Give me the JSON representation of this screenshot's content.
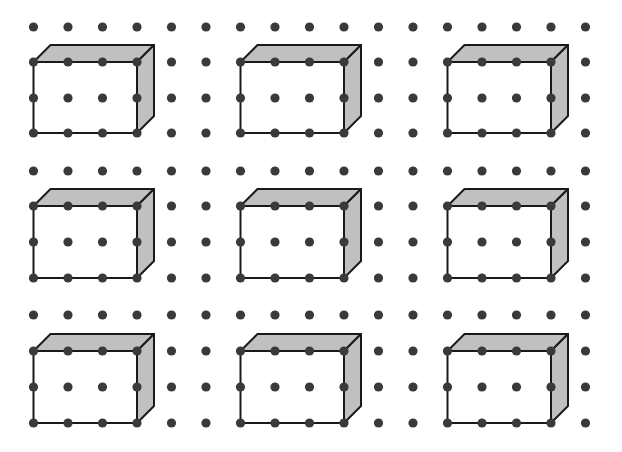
{
  "diagram": {
    "title": "Dot grid with 3×3 array of rectangular prisms",
    "canvas": {
      "width": 622,
      "height": 452,
      "background": "#ffffff"
    },
    "colors": {
      "dot": "#3a3a3a",
      "edge": "#1a1a1a",
      "face_front": "#ffffff",
      "face_shaded": "#c0c0c0"
    },
    "grid": {
      "columns_x": [
        33.5,
        68,
        102.5,
        137,
        171.5,
        206,
        240.5,
        275,
        309.5,
        344,
        378.5,
        413,
        447.5,
        482,
        516.5,
        551,
        585.5
      ],
      "row_blocks": [
        [
          27,
          62,
          98,
          133
        ],
        [
          171,
          206,
          242,
          278
        ],
        [
          315,
          351,
          387,
          423
        ]
      ],
      "dot_radius": 4.6
    },
    "prism": {
      "front_width_units": 3,
      "front_height_units": 2,
      "depth_offset": [
        17,
        -17
      ],
      "edge_width": 2,
      "start_columns": [
        0,
        6,
        12
      ],
      "front_top_row_index_in_block": 1
    },
    "prisms": [
      {
        "row_block": 0,
        "col": 0
      },
      {
        "row_block": 0,
        "col": 6
      },
      {
        "row_block": 0,
        "col": 12
      },
      {
        "row_block": 1,
        "col": 0
      },
      {
        "row_block": 1,
        "col": 6
      },
      {
        "row_block": 1,
        "col": 12
      },
      {
        "row_block": 2,
        "col": 0
      },
      {
        "row_block": 2,
        "col": 6
      },
      {
        "row_block": 2,
        "col": 12
      }
    ]
  }
}
